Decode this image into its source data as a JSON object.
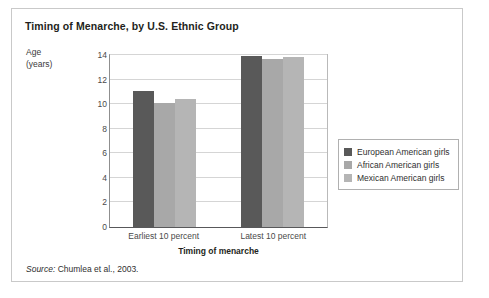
{
  "figure": {
    "title": "Timing of Menarche, by U.S. Ethnic Group",
    "source_label": "Source:",
    "source_text": "Chumlea et al., 2003."
  },
  "chart_data": {
    "type": "bar",
    "title": "Timing of Menarche, by U.S. Ethnic Group",
    "xlabel": "Timing of menarche",
    "ylabel": "Age (years)",
    "ylabel_line1": "Age",
    "ylabel_line2": "(years)",
    "categories": [
      "Earliest 10 percent",
      "Latest 10 percent"
    ],
    "yticks": [
      0,
      2,
      4,
      6,
      8,
      10,
      12,
      14
    ],
    "ylim": [
      0,
      14
    ],
    "grid": true,
    "legend_position": "right",
    "series": [
      {
        "name": "European American girls",
        "color": "#595959",
        "values": [
          11.1,
          13.9
        ]
      },
      {
        "name": "African American girls",
        "color": "#a8a8a8",
        "values": [
          10.1,
          13.7
        ]
      },
      {
        "name": "Mexican American girls",
        "color": "#b5b5b5",
        "values": [
          10.4,
          13.8
        ]
      }
    ]
  }
}
